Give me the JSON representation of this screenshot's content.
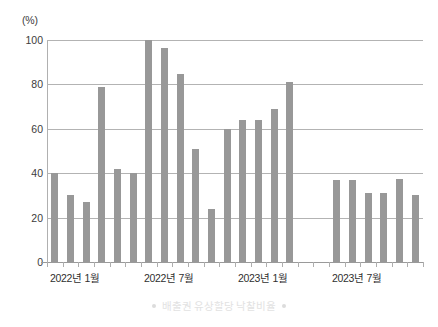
{
  "chart_data": {
    "type": "bar",
    "title": "",
    "subtitle": "",
    "unit_label": "(%)",
    "xlabel": "",
    "ylabel": "",
    "ylim": [
      0,
      100
    ],
    "yticks": [
      0,
      20,
      40,
      60,
      80,
      100
    ],
    "ytick_labels": [
      "0",
      "20",
      "40",
      "60",
      "80",
      "100"
    ],
    "grid": true,
    "legend_position": "bottom",
    "series_color": "#989898",
    "categories": [
      "2022년 1월",
      "2022년 2월",
      "2022년 3월",
      "2022년 4월",
      "2022년 5월",
      "2022년 6월",
      "2022년 7월",
      "2022년 8월",
      "2022년 9월",
      "2022년 10월",
      "2022년 11월",
      "2022년 12월",
      "2023년 1월",
      "2023년 2월",
      "2023년 3월",
      "2023년 4월",
      "2023년 5월",
      "2023년 6월",
      "2023년 7월",
      "2023년 8월",
      "2023년 9월",
      "2023년 10월",
      "2023년 11월",
      "2023년 12월"
    ],
    "xtick_labels": [
      "2022년 1월",
      "2022년 7월",
      "2023년 1월",
      "2023년 7월"
    ],
    "xtick_label_indices": [
      0,
      6,
      12,
      18
    ],
    "series": [
      {
        "name": "배출권 유상할당 낙찰비율",
        "values": [
          40,
          30,
          27,
          79,
          42,
          40,
          100,
          96.5,
          84.5,
          51,
          24,
          60,
          64,
          64,
          69,
          81,
          null,
          null,
          37,
          37,
          31,
          31,
          37.5,
          30
        ]
      }
    ],
    "legend": [
      {
        "label": "배출권 유상할당 낙찰비율",
        "color": "#dcdcdc"
      }
    ]
  },
  "legend_marker_left": "•",
  "legend_marker_right": "•"
}
